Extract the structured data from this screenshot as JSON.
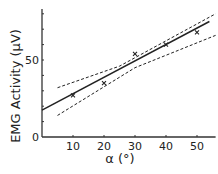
{
  "chart_data": {
    "type": "scatter",
    "title": "",
    "xlabel": "α (°)",
    "ylabel": "EMG Activity (μV)",
    "x_ticks": [
      "10",
      "20",
      "30",
      "40",
      "50"
    ],
    "y_ticks": [
      "0",
      "50"
    ],
    "xlim": [
      0,
      56
    ],
    "ylim": [
      0,
      83
    ],
    "grid": false,
    "legend": "none",
    "series": [
      {
        "name": "data",
        "marker": "x",
        "x": [
          10,
          20,
          30,
          40,
          50
        ],
        "y": [
          27,
          35,
          54,
          60,
          68
        ]
      },
      {
        "name": "regression",
        "style": "solid",
        "x": [
          0,
          54
        ],
        "y": [
          17.5,
          75
        ]
      },
      {
        "name": "upper confidence band",
        "style": "dashed",
        "x": [
          5,
          25,
          56
        ],
        "y": [
          32,
          46,
          80
        ]
      },
      {
        "name": "lower confidence band",
        "style": "dashed",
        "x": [
          5,
          30,
          56
        ],
        "y": [
          14,
          45,
          66
        ]
      }
    ]
  }
}
